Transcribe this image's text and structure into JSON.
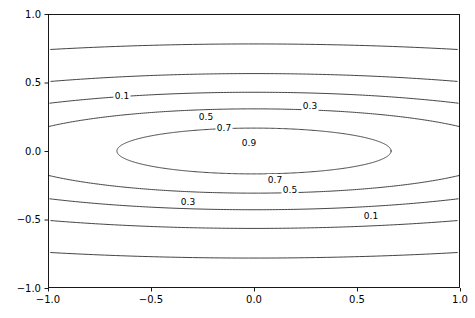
{
  "figure": {
    "width": 475,
    "height": 318,
    "background_color": "#ffffff",
    "line_color": "#3a3a3a",
    "axis_color": "#000000"
  },
  "axes": {
    "left_px": 48,
    "right_px": 460,
    "top_px": 14,
    "bottom_px": 288,
    "xlim": [
      -1.0,
      1.0
    ],
    "ylim": [
      -1.0,
      1.0
    ]
  },
  "chart_data": {
    "type": "line",
    "subtype": "contour",
    "title": "",
    "xlabel": "",
    "ylabel": "",
    "xlim": [
      -1.0,
      1.0
    ],
    "ylim": [
      -1.0,
      1.0
    ],
    "grid": false,
    "legend": false,
    "xticks": [
      -1.0,
      -0.5,
      0.0,
      0.5,
      1.0
    ],
    "yticks": [
      -1.0,
      -0.5,
      0.0,
      0.5,
      1.0
    ],
    "xtick_labels": [
      "-1.0",
      "-0.5",
      "0.0",
      "0.5",
      "1.0"
    ],
    "ytick_labels": [
      "-1.0",
      "-0.5",
      "0.0",
      "0.5",
      "1.0"
    ],
    "levels": [
      0.1,
      0.3,
      0.5,
      0.7,
      0.9
    ],
    "level_labels": [
      "0.1",
      "0.3",
      "0.5",
      "0.7",
      "0.9"
    ],
    "function": "z = exp(-(x^2/a^2 + y^2/b^2))",
    "field": {
      "center": [
        0.0,
        0.0
      ],
      "x_scale": 2.05,
      "y_scale": 0.515
    },
    "contour_labels": [
      {
        "text": "0.1",
        "x_px": 122,
        "y_px": 96
      },
      {
        "text": "0.3",
        "x_px": 310,
        "y_px": 106
      },
      {
        "text": "0.5",
        "x_px": 206,
        "y_px": 117
      },
      {
        "text": "0.7",
        "x_px": 224,
        "y_px": 128
      },
      {
        "text": "0.9",
        "x_px": 249,
        "y_px": 143
      },
      {
        "text": "0.7",
        "x_px": 275,
        "y_px": 180
      },
      {
        "text": "0.5",
        "x_px": 290,
        "y_px": 190
      },
      {
        "text": "0.3",
        "x_px": 188,
        "y_px": 202
      },
      {
        "text": "0.1",
        "x_px": 371,
        "y_px": 216
      }
    ]
  }
}
